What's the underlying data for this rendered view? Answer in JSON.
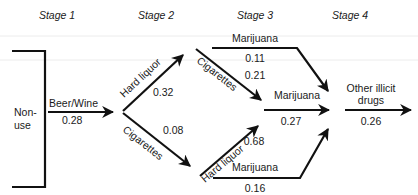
{
  "diagram": {
    "type": "stage-sequence-flow",
    "stages": [
      {
        "label": "Stage 1"
      },
      {
        "label": "Stage 2"
      },
      {
        "label": "Stage 3"
      },
      {
        "label": "Stage 4"
      }
    ],
    "start_node": {
      "line1": "Non-",
      "line2": "use"
    },
    "end_node": {
      "line1": "Other illicit",
      "line2": "drugs"
    },
    "edges": {
      "beer_wine": {
        "label": "Beer/Wine",
        "value": "0.28"
      },
      "hard_liquor_stage2": {
        "label": "Hard liquor",
        "value": "0.32"
      },
      "cigarettes_stage2": {
        "label": "Cigarettes",
        "value": "0.08"
      },
      "marijuana_top": {
        "label": "Marijuana",
        "value": "0.11"
      },
      "cigarettes_stage3": {
        "label": "Cigarettes",
        "value": "0.21"
      },
      "marijuana_middle": {
        "label": "Marijuana",
        "value": "0.27"
      },
      "hard_liquor_stage3": {
        "label": "Hard liquor",
        "value": "0.68"
      },
      "marijuana_bottom": {
        "label": "Marijuana",
        "value": "0.16"
      },
      "other_illicit": {
        "value": "0.26"
      }
    },
    "colors": {
      "line": "#111111",
      "text": "#1a1a1a",
      "background": "#ffffff"
    }
  }
}
